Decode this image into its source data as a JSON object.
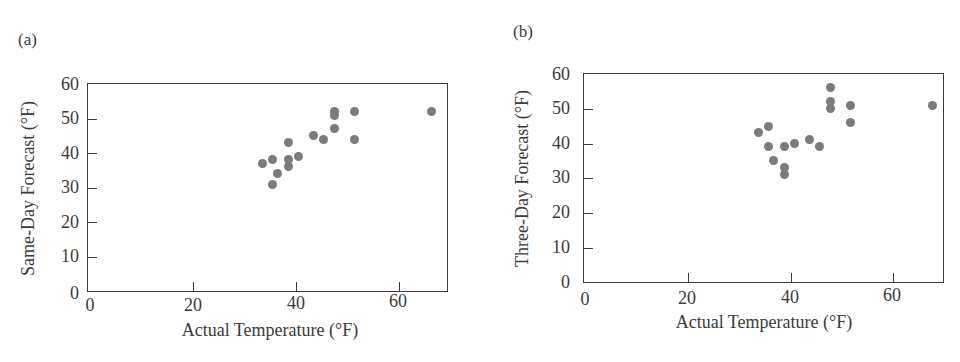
{
  "chart_data": [
    {
      "type": "scatter",
      "panel_label": "(a)",
      "title": "",
      "xlabel": "Actual Temperature (°F)",
      "ylabel": "Same-Day Forecast (°F)",
      "xlim": [
        0,
        70
      ],
      "ylim": [
        0,
        60
      ],
      "xticks": [
        "0",
        "20",
        "40",
        "60"
      ],
      "yticks": [
        "0",
        "10",
        "20",
        "30",
        "40",
        "50",
        "60"
      ],
      "grid": false,
      "marker_color": "#7b7b7b",
      "points": [
        {
          "x": 34,
          "y": 37
        },
        {
          "x": 36,
          "y": 38
        },
        {
          "x": 36,
          "y": 31
        },
        {
          "x": 37,
          "y": 34
        },
        {
          "x": 39,
          "y": 43
        },
        {
          "x": 39,
          "y": 38
        },
        {
          "x": 39,
          "y": 36
        },
        {
          "x": 41,
          "y": 39
        },
        {
          "x": 44,
          "y": 45
        },
        {
          "x": 46,
          "y": 44
        },
        {
          "x": 48,
          "y": 52
        },
        {
          "x": 48,
          "y": 51
        },
        {
          "x": 48,
          "y": 47
        },
        {
          "x": 52,
          "y": 52
        },
        {
          "x": 52,
          "y": 44
        },
        {
          "x": 67,
          "y": 52
        }
      ]
    },
    {
      "type": "scatter",
      "panel_label": "(b)",
      "title": "",
      "xlabel": "Actual Temperature (°F)",
      "ylabel": "Three-Day Forecast (°F)",
      "xlim": [
        0,
        70
      ],
      "ylim": [
        0,
        60
      ],
      "xticks": [
        "0",
        "20",
        "40",
        "60"
      ],
      "yticks": [
        "0",
        "10",
        "20",
        "30",
        "40",
        "50",
        "60"
      ],
      "grid": false,
      "marker_color": "#7b7b7b",
      "points": [
        {
          "x": 34,
          "y": 43
        },
        {
          "x": 36,
          "y": 45
        },
        {
          "x": 36,
          "y": 39
        },
        {
          "x": 37,
          "y": 35
        },
        {
          "x": 39,
          "y": 39
        },
        {
          "x": 39,
          "y": 33
        },
        {
          "x": 39,
          "y": 31
        },
        {
          "x": 41,
          "y": 40
        },
        {
          "x": 44,
          "y": 41
        },
        {
          "x": 46,
          "y": 39
        },
        {
          "x": 48,
          "y": 56
        },
        {
          "x": 48,
          "y": 52
        },
        {
          "x": 48,
          "y": 50
        },
        {
          "x": 52,
          "y": 51
        },
        {
          "x": 52,
          "y": 46
        },
        {
          "x": 68,
          "y": 51
        }
      ]
    }
  ]
}
